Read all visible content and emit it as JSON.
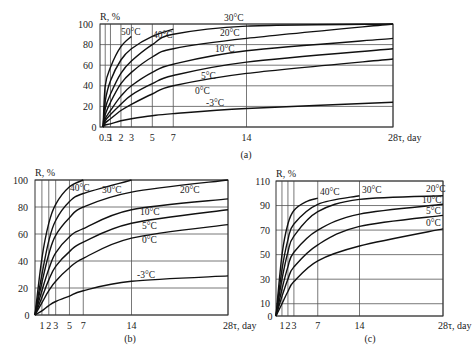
{
  "chart_data": [
    {
      "id": "a",
      "type": "line",
      "caption": "(a)",
      "title": "",
      "xlabel": "τ, day",
      "ylabel": "R, %",
      "xlim": [
        0,
        28
      ],
      "ylim": [
        0,
        100
      ],
      "xticks": [
        0.5,
        1,
        2,
        3,
        5,
        7,
        14,
        28
      ],
      "xtick_labels": [
        "0.5",
        "1",
        "2",
        "3",
        "5",
        "7",
        "14",
        "28τ, day"
      ],
      "yticks": [
        0,
        20,
        40,
        60,
        80,
        100
      ],
      "grid": true,
      "series": [
        {
          "name": "50°C",
          "x": [
            0.5,
            1,
            2,
            3
          ],
          "y": [
            40,
            58,
            78,
            88
          ]
        },
        {
          "name": "40°C",
          "x": [
            0.5,
            1,
            2,
            3,
            5,
            7
          ],
          "y": [
            25,
            45,
            65,
            76,
            88,
            95
          ]
        },
        {
          "name": "30°C",
          "x": [
            0.5,
            1,
            2,
            3,
            5,
            7,
            14,
            28
          ],
          "y": [
            18,
            32,
            52,
            64,
            80,
            90,
            98,
            100
          ]
        },
        {
          "name": "20°C",
          "x": [
            0.5,
            1,
            2,
            3,
            5,
            7,
            14,
            28
          ],
          "y": [
            12,
            24,
            42,
            53,
            68,
            76,
            86,
            100
          ]
        },
        {
          "name": "10°C",
          "x": [
            0.5,
            1,
            2,
            3,
            5,
            7,
            14,
            28
          ],
          "y": [
            8,
            16,
            30,
            40,
            53,
            61,
            74,
            86
          ]
        },
        {
          "name": "5°C",
          "x": [
            0.5,
            1,
            2,
            3,
            5,
            7,
            14,
            28
          ],
          "y": [
            6,
            12,
            22,
            31,
            42,
            50,
            63,
            76
          ]
        },
        {
          "name": "0°C",
          "x": [
            0.5,
            1,
            2,
            3,
            5,
            7,
            14,
            28
          ],
          "y": [
            4,
            8,
            16,
            22,
            32,
            40,
            52,
            66
          ]
        },
        {
          "name": "-3°C",
          "x": [
            0.5,
            1,
            2,
            3,
            5,
            7,
            14,
            28
          ],
          "y": [
            2,
            3,
            6,
            8,
            11,
            13,
            18,
            24
          ]
        }
      ]
    },
    {
      "id": "b",
      "type": "line",
      "caption": "(b)",
      "title": "",
      "xlabel": "τ, day",
      "ylabel": "R, %",
      "xlim": [
        0,
        28
      ],
      "ylim": [
        0,
        100
      ],
      "xticks": [
        1,
        2,
        3,
        5,
        7,
        14,
        28
      ],
      "xtick_labels": [
        "1",
        "2",
        "3",
        "5",
        "7",
        "14",
        "28τ, day"
      ],
      "yticks": [
        0,
        20,
        40,
        60,
        80,
        100
      ],
      "grid": true,
      "series": [
        {
          "name": "40°C",
          "x": [
            0,
            1,
            2,
            3,
            5,
            7
          ],
          "y": [
            0,
            42,
            68,
            82,
            95,
            100
          ]
        },
        {
          "name": "30°C",
          "x": [
            0,
            1,
            2,
            3,
            5,
            7,
            14
          ],
          "y": [
            0,
            30,
            55,
            70,
            84,
            90,
            100
          ]
        },
        {
          "name": "20°C",
          "x": [
            0,
            1,
            2,
            3,
            5,
            7,
            14,
            28
          ],
          "y": [
            0,
            24,
            45,
            59,
            72,
            80,
            91,
            100
          ]
        },
        {
          "name": "10°C",
          "x": [
            0,
            1,
            2,
            3,
            5,
            7,
            14,
            28
          ],
          "y": [
            0,
            18,
            34,
            46,
            58,
            64,
            78,
            86
          ]
        },
        {
          "name": "5°C",
          "x": [
            0,
            1,
            2,
            3,
            5,
            7,
            14,
            28
          ],
          "y": [
            0,
            13,
            26,
            36,
            47,
            54,
            68,
            78
          ]
        },
        {
          "name": "0°C",
          "x": [
            0,
            1,
            2,
            3,
            5,
            7,
            14,
            28
          ],
          "y": [
            0,
            9,
            18,
            25,
            35,
            42,
            57,
            67
          ]
        },
        {
          "name": "-3°C",
          "x": [
            0,
            1,
            2,
            3,
            5,
            7,
            14,
            28
          ],
          "y": [
            0,
            3,
            7,
            10,
            14,
            18,
            25,
            29
          ]
        }
      ]
    },
    {
      "id": "c",
      "type": "line",
      "caption": "(c)",
      "title": "",
      "xlabel": "τ, day",
      "ylabel": "R, %",
      "xlim": [
        0,
        28
      ],
      "ylim": [
        0,
        110
      ],
      "xticks": [
        1,
        2,
        3,
        7,
        14,
        28
      ],
      "xtick_labels": [
        "1",
        "2",
        "3",
        "7",
        "14",
        "28τ, day"
      ],
      "yticks": [
        0,
        10,
        30,
        50,
        70,
        90,
        110
      ],
      "grid": true,
      "series": [
        {
          "name": "40°C",
          "x": [
            0,
            1,
            2,
            3,
            5,
            7
          ],
          "y": [
            0,
            50,
            75,
            86,
            93,
            96
          ]
        },
        {
          "name": "30°C",
          "x": [
            0,
            1,
            2,
            3,
            7,
            14
          ],
          "y": [
            0,
            38,
            62,
            75,
            91,
            98
          ]
        },
        {
          "name": "20°C",
          "x": [
            0,
            1,
            2,
            3,
            7,
            14,
            28
          ],
          "y": [
            0,
            30,
            52,
            65,
            85,
            95,
            98
          ]
        },
        {
          "name": "10°C",
          "x": [
            0,
            1,
            2,
            3,
            7,
            14,
            28
          ],
          "y": [
            0,
            22,
            40,
            52,
            70,
            83,
            91
          ]
        },
        {
          "name": "5°C",
          "x": [
            0,
            1,
            2,
            3,
            7,
            14,
            28
          ],
          "y": [
            0,
            16,
            30,
            40,
            58,
            73,
            82
          ]
        },
        {
          "name": "0°C",
          "x": [
            0,
            1,
            2,
            3,
            7,
            14,
            28
          ],
          "y": [
            0,
            10,
            20,
            28,
            45,
            57,
            71
          ]
        }
      ]
    }
  ]
}
